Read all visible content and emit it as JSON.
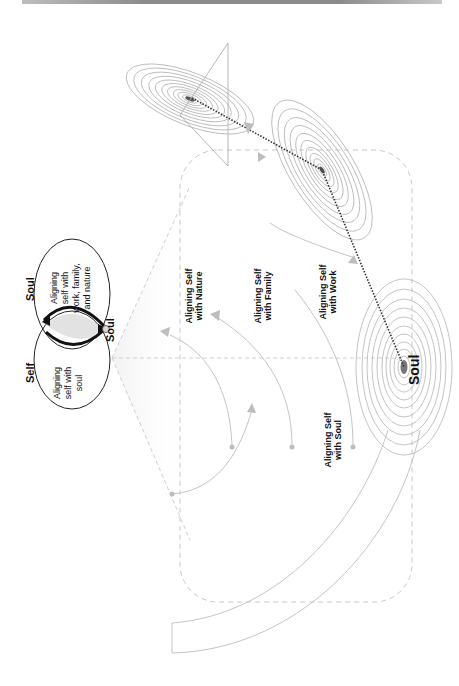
{
  "figure": {
    "venn": {
      "left_title": "Self",
      "right_title": "Soul",
      "center_label": "Soul",
      "left_text": [
        "Aligning",
        "self with",
        "soul"
      ],
      "right_text": [
        "Aligning",
        "self with",
        "work, family,",
        "and nature"
      ]
    },
    "field_labels": {
      "nature": [
        "Aligning Self",
        "with Nature"
      ],
      "family": [
        "Aligning Self",
        "with Family"
      ],
      "work": [
        "Aligning Self",
        "with Work"
      ],
      "soul": [
        "Aligning Self",
        "with Soul"
      ]
    },
    "soul_node_label": "Soul",
    "colors": {
      "contour": "#b5b5b5",
      "dashed": "#c8c8c8",
      "arrow": "#bdbdbd",
      "path": "#333333",
      "text": "#111111"
    }
  }
}
